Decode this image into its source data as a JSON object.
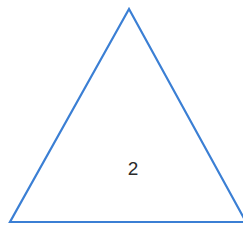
{
  "diagram": {
    "shape": "triangle",
    "label": "2",
    "stroke_color": "#3b7fd4",
    "fill_color": "#ffffff",
    "vertices": {
      "apex": [
        129,
        9
      ],
      "bottom_left": [
        10,
        222
      ],
      "bottom_right": [
        243,
        222
      ]
    }
  }
}
